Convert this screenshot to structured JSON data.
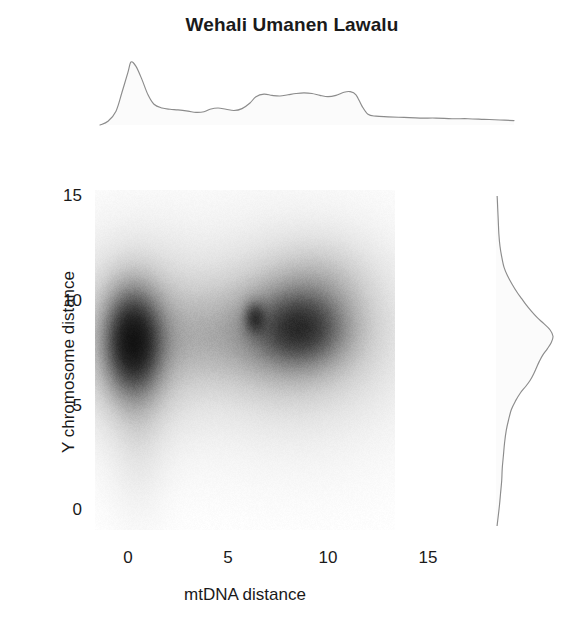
{
  "chart_data": {
    "type": "heatmap",
    "subtype": "joint-kde-with-marginals",
    "title": "Wehali Umanen Lawalu",
    "xlabel": "mtDNA distance",
    "ylabel": "Y chromosome distance",
    "xlim": [
      -1.5,
      19.5
    ],
    "ylim": [
      -1.5,
      16.5
    ],
    "xticks": [
      0,
      5,
      10,
      15
    ],
    "xtick_labels": [
      "0",
      "5",
      "10",
      "15"
    ],
    "yticks": [
      0,
      5,
      10,
      15
    ],
    "ytick_labels": [
      "0",
      "5",
      "10",
      "15"
    ],
    "grid": false,
    "legend": false,
    "colormap": "greys",
    "colormap_levels": [
      "#ffffff",
      "#f2f2f2",
      "#e3e3e3",
      "#cfcfcf",
      "#b4b4b4",
      "#949494",
      "#6e6e6e",
      "#474747",
      "#262626",
      "#121212"
    ],
    "joint_density": {
      "description": "Two-dimensional kernel density of paired mtDNA and Y-chromosome distances. One dominant tight mode near zero mtDNA distance plus a broad secondary ridge at intermediate-to-high mtDNA distance.",
      "modes": [
        {
          "name": "primary-mode",
          "x": 0.2,
          "y": 8.1,
          "peak_level": 1.0,
          "sigma_x": 0.95,
          "sigma_y": 1.65
        },
        {
          "name": "primary-mode-halo",
          "x": 0.4,
          "y": 8.2,
          "peak_level": 0.34,
          "sigma_x": 2.1,
          "sigma_y": 2.6
        },
        {
          "name": "primary-lower-tail",
          "x": 0.5,
          "y": 4.6,
          "peak_level": 0.1,
          "sigma_x": 0.9,
          "sigma_y": 2.6
        },
        {
          "name": "secondary-core",
          "x": 8.6,
          "y": 8.7,
          "peak_level": 0.58,
          "sigma_x": 1.45,
          "sigma_y": 1.15
        },
        {
          "name": "secondary-subcore",
          "x": 6.3,
          "y": 9.2,
          "peak_level": 0.46,
          "sigma_x": 0.35,
          "sigma_y": 0.5
        },
        {
          "name": "secondary-ridge",
          "x": 8.0,
          "y": 8.6,
          "peak_level": 0.36,
          "sigma_x": 2.6,
          "sigma_y": 1.9
        },
        {
          "name": "secondary-halo",
          "x": 8.2,
          "y": 8.4,
          "peak_level": 0.19,
          "sigma_x": 3.6,
          "sigma_y": 3.0
        },
        {
          "name": "bridge",
          "x": 3.6,
          "y": 8.3,
          "peak_level": 0.12,
          "sigma_x": 1.9,
          "sigma_y": 1.5
        },
        {
          "name": "upper-shoulder",
          "x": 9.6,
          "y": 11.0,
          "peak_level": 0.13,
          "sigma_x": 1.6,
          "sigma_y": 1.3
        }
      ]
    },
    "top_marginal": {
      "axis": "x",
      "variable": "mtDNA distance",
      "description": "Marginal density of mtDNA distance: sharp narrow peak at 0, shallow trough near 3, broad plateau between 6 and 11, abrupt drop after 11.5, long low tail to 19.",
      "x": [
        -1.4,
        -1.0,
        -0.6,
        -0.3,
        0.0,
        0.15,
        0.4,
        0.7,
        1.0,
        1.3,
        1.7,
        2.1,
        2.5,
        3.0,
        3.4,
        3.8,
        4.1,
        4.5,
        4.9,
        5.3,
        5.7,
        6.1,
        6.4,
        6.8,
        7.2,
        7.6,
        8.0,
        8.4,
        8.8,
        9.2,
        9.6,
        10.0,
        10.4,
        10.8,
        11.1,
        11.4,
        11.7,
        12.0,
        12.4,
        13.0,
        13.8,
        14.6,
        15.4,
        16.2,
        17.0,
        17.8,
        18.6,
        19.3
      ],
      "y": [
        0.0,
        0.06,
        0.22,
        0.52,
        0.84,
        1.0,
        0.93,
        0.72,
        0.48,
        0.33,
        0.27,
        0.25,
        0.24,
        0.22,
        0.2,
        0.21,
        0.25,
        0.27,
        0.25,
        0.23,
        0.26,
        0.35,
        0.45,
        0.49,
        0.47,
        0.46,
        0.48,
        0.5,
        0.51,
        0.5,
        0.47,
        0.45,
        0.47,
        0.52,
        0.53,
        0.48,
        0.3,
        0.17,
        0.14,
        0.13,
        0.12,
        0.11,
        0.11,
        0.1,
        0.1,
        0.09,
        0.08,
        0.07
      ]
    },
    "right_marginal": {
      "axis": "y",
      "variable": "Y chromosome distance",
      "description": "Marginal density of Y chromosome distance: single main peak near 8.5 with a shoulder around 6, narrow upper tail toward 15 and a long low tail toward 0.",
      "y": [
        15.6,
        15.0,
        14.4,
        13.8,
        13.2,
        12.6,
        12.1,
        11.6,
        11.2,
        10.8,
        10.4,
        10.1,
        9.8,
        9.5,
        9.2,
        8.9,
        8.6,
        8.3,
        8.0,
        7.7,
        7.4,
        7.1,
        6.8,
        6.5,
        6.2,
        5.9,
        5.6,
        5.2,
        4.8,
        4.3,
        3.8,
        3.2,
        2.6,
        2.0,
        1.4,
        0.8,
        0.2,
        -0.5,
        -1.2
      ],
      "x": [
        0.0,
        0.02,
        0.03,
        0.04,
        0.05,
        0.07,
        0.1,
        0.14,
        0.2,
        0.28,
        0.37,
        0.45,
        0.53,
        0.62,
        0.72,
        0.84,
        0.95,
        1.0,
        0.97,
        0.9,
        0.82,
        0.76,
        0.71,
        0.66,
        0.6,
        0.52,
        0.43,
        0.34,
        0.27,
        0.22,
        0.18,
        0.15,
        0.13,
        0.11,
        0.1,
        0.08,
        0.06,
        0.03,
        0.0
      ]
    },
    "line_color": "#8c8c8c",
    "fill_color": "#fbfbfb",
    "text_color": "#1a1a1a"
  },
  "axes": {
    "x_title": "mtDNA distance",
    "y_title": "Y chromosome distance",
    "x_ticks": [
      {
        "label": "0",
        "value": 0
      },
      {
        "label": "5",
        "value": 5
      },
      {
        "label": "10",
        "value": 10
      },
      {
        "label": "15",
        "value": 15
      }
    ],
    "y_ticks": [
      {
        "label": "15",
        "value": 15
      },
      {
        "label": "10",
        "value": 10
      },
      {
        "label": "5",
        "value": 5
      },
      {
        "label": "0",
        "value": 0
      }
    ]
  },
  "title": "Wehali Umanen Lawalu"
}
